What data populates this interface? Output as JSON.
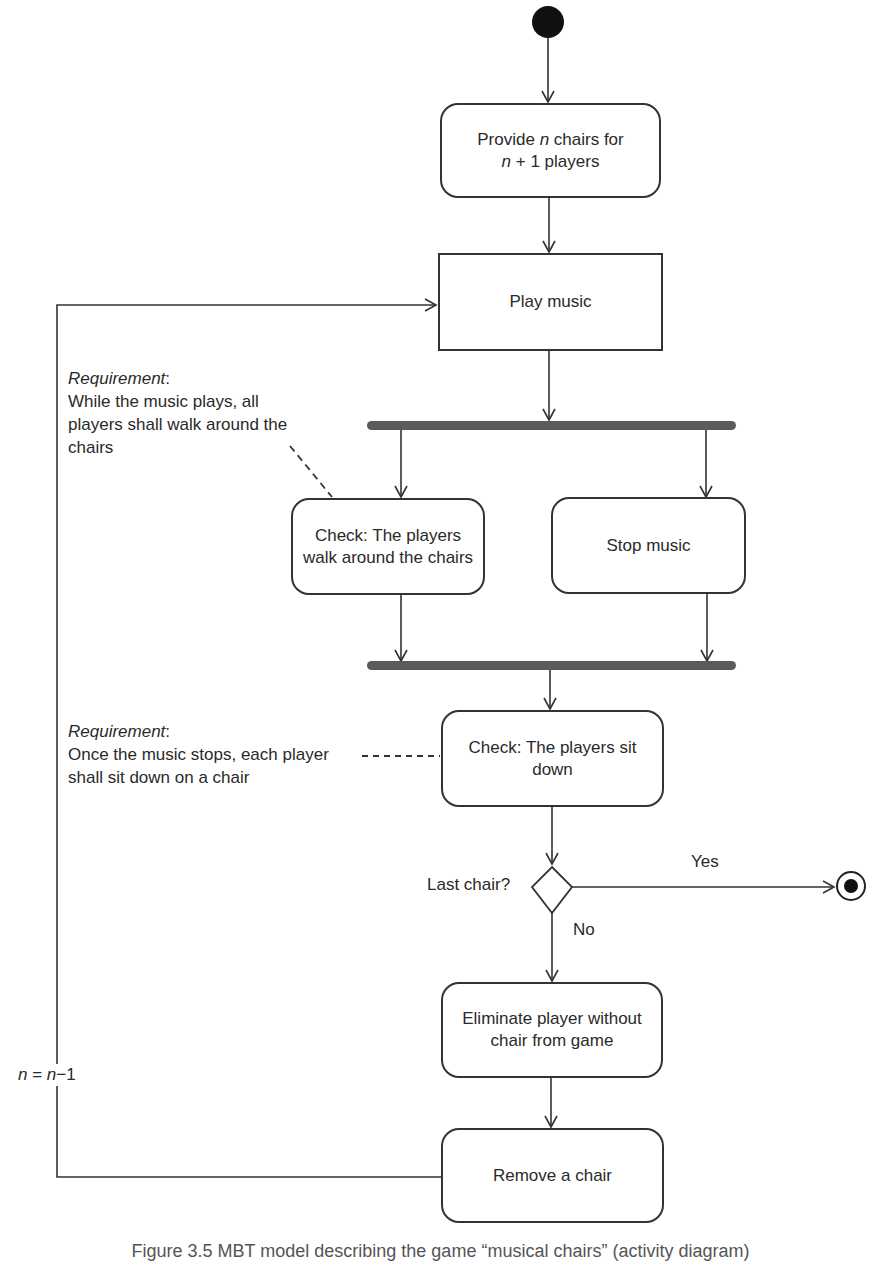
{
  "diagram": {
    "type": "UML activity diagram",
    "start_node": {
      "icon": "initial-node-icon"
    },
    "end_node": {
      "icon": "final-node-icon"
    },
    "actions": {
      "provide_chairs": {
        "prefix": "Provide ",
        "var1": "n",
        "mid": " chairs for",
        "var2": "n",
        "suffix": " + 1 players"
      },
      "play_music": "Play music",
      "check_walk": {
        "line1": "Check: The players",
        "line2": "walk around the chairs"
      },
      "stop_music": "Stop music",
      "check_sit": {
        "line1": "Check: The players sit",
        "line2": "down"
      },
      "eliminate": {
        "line1": "Eliminate player without",
        "line2": "chair from game"
      },
      "remove_chair": "Remove a chair"
    },
    "decision": {
      "label": "Last chair?",
      "yes_label": "Yes",
      "no_label": "No"
    },
    "loop_guard": {
      "lhs": "n",
      "eq": " = ",
      "rhs": "n",
      "op": "−1"
    },
    "notes": [
      {
        "title": "Requirement",
        "title_suffix": ":",
        "lines": [
          "While the music plays, all",
          "players shall walk around the",
          "chairs"
        ]
      },
      {
        "title": "Requirement",
        "title_suffix": ":",
        "lines": [
          "Once the music stops, each player",
          "shall sit down on a chair"
        ]
      }
    ],
    "colors": {
      "line": "#333333",
      "bar": "#5a5a5a",
      "background": "#ffffff"
    }
  },
  "caption": "Figure 3.5   MBT model describing the game “musical chairs” (activity diagram)"
}
